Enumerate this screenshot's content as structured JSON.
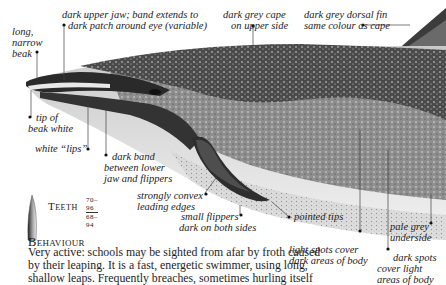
{
  "illustration": {
    "subject": "dolphin-side-view",
    "colors": {
      "cape": "#3a3a3a",
      "flank": "#8a8a8a",
      "underside": "#e6e6e6",
      "paper": "#ffffff"
    }
  },
  "annotations": [
    {
      "id": "long-narrow-beak",
      "lines": [
        "long,",
        "narrow",
        "beak"
      ]
    },
    {
      "id": "dark-upper-jaw",
      "lines": [
        "dark upper jaw; band extends to",
        "dark patch around eye (variable)"
      ]
    },
    {
      "id": "dark-grey-cape",
      "lines": [
        "dark grey cape",
        "on upper side"
      ]
    },
    {
      "id": "dorsal-fin",
      "lines": [
        "dark grey dorsal fin",
        "same colour as cape"
      ]
    },
    {
      "id": "tip-of-beak",
      "lines": [
        "tip of",
        "beak white"
      ]
    },
    {
      "id": "white-lips",
      "lines": [
        "white “lips”"
      ]
    },
    {
      "id": "dark-band",
      "lines": [
        "dark band",
        "between lower",
        "jaw and flippers"
      ]
    },
    {
      "id": "convex-edges",
      "lines": [
        "strongly convex",
        "leading edges"
      ]
    },
    {
      "id": "small-flippers",
      "lines": [
        "small flippers",
        "dark on both sides"
      ]
    },
    {
      "id": "pointed-tips",
      "lines": [
        "pointed tips"
      ]
    },
    {
      "id": "light-spots",
      "lines": [
        "light spots cover",
        "dark areas of body"
      ]
    },
    {
      "id": "dark-spots",
      "lines": [
        "dark spots",
        "cover light",
        "areas of body"
      ]
    },
    {
      "id": "pale-underside",
      "lines": [
        "pale grey",
        "underside"
      ]
    }
  ],
  "teeth": {
    "label": "Teeth",
    "upper": "70–96",
    "lower": "68–94"
  },
  "behaviour": {
    "heading": "Behaviour",
    "lines": [
      "Very active: schools may be sighted from afar by froth caused",
      "by their leaping. It is a fast, energetic swimmer, using long,",
      "shallow leaps. Frequently breaches, sometimes hurling itself"
    ]
  }
}
